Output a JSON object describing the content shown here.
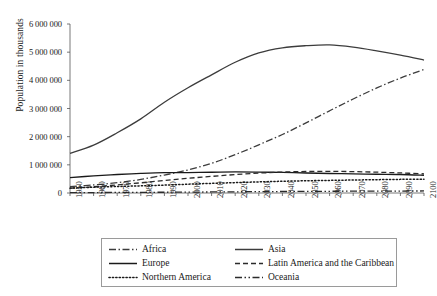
{
  "chart_data": {
    "type": "line",
    "title": "",
    "xlabel": "",
    "ylabel": "Population in thousands",
    "xlim": [
      1950,
      2100
    ],
    "ylim": [
      0,
      6000000
    ],
    "grid": false,
    "legend_position": "bottom",
    "x": [
      1950,
      1960,
      1970,
      1980,
      1990,
      2000,
      2010,
      2020,
      2030,
      2040,
      2050,
      2060,
      2070,
      2080,
      2090,
      2100
    ],
    "xticklabels": [
      "1950",
      "1960",
      "1970",
      "1980",
      "1990",
      "2000",
      "2010",
      "2020",
      "2030",
      "2040",
      "2050",
      "2060",
      "2070",
      "2080",
      "2090",
      "2100"
    ],
    "yticklabels": [
      "0",
      "1 000 000",
      "2 000 000",
      "3 000 000",
      "4 000 000",
      "5 000 000",
      "6 000 000"
    ],
    "yticks": [
      0,
      1000000,
      2000000,
      3000000,
      4000000,
      5000000,
      6000000
    ],
    "series": [
      {
        "name": "Africa",
        "style": "dash-dot",
        "color": "#3c3c3c",
        "values": [
          228670,
          285141,
          365444,
          481536,
          638150,
          818952,
          1055228,
          1360681,
          1710610,
          2077202,
          2489275,
          2918444,
          3337565,
          3730258,
          4080491,
          4386591
        ]
      },
      {
        "name": "Asia",
        "style": "solid",
        "color": "#3c3c3c",
        "values": [
          1404062,
          1700442,
          2138529,
          2632335,
          3221349,
          3735089,
          4194425,
          4641055,
          4974306,
          5154419,
          5230625,
          5259377,
          5180010,
          5047442,
          4895149,
          4719442
        ]
      },
      {
        "name": "Europe",
        "style": "solid",
        "color": "#1a1a1a",
        "values": [
          549375,
          605422,
          656575,
          693591,
          720858,
          726568,
          736412,
          747636,
          741474,
          728823,
          710486,
          692556,
          677335,
          665521,
          656129,
          629563
        ]
      },
      {
        "name": "Latin America and the Caribbean",
        "style": "dashed",
        "color": "#2b2b2b",
        "values": [
          168918,
          220474,
          287534,
          361401,
          443000,
          521836,
          590082,
          653962,
          706328,
          742238,
          762432,
          767586,
          759292,
          740256,
          713244,
          679993
        ]
      },
      {
        "name": "Northern America",
        "style": "dotted",
        "color": "#1a1a1a",
        "values": [
          172603,
          204152,
          231276,
          254122,
          280351,
          312426,
          343028,
          368870,
          394671,
          417054,
          434674,
          448116,
          461018,
          473244,
          484056,
          490889
        ]
      },
      {
        "name": "Oceania",
        "style": "dash-dot-dot",
        "color": "#2b2b2b",
        "values": [
          12648,
          15888,
          19679,
          22900,
          26996,
          31222,
          36659,
          42678,
          48125,
          53019,
          57376,
          61153,
          64424,
          67351,
          69901,
          71898
        ]
      }
    ]
  },
  "legend": {
    "entries": [
      {
        "label": "Africa"
      },
      {
        "label": "Asia"
      },
      {
        "label": "Europe"
      },
      {
        "label": "Latin America and the Caribbean"
      },
      {
        "label": "Northern America"
      },
      {
        "label": "Oceania"
      }
    ]
  }
}
